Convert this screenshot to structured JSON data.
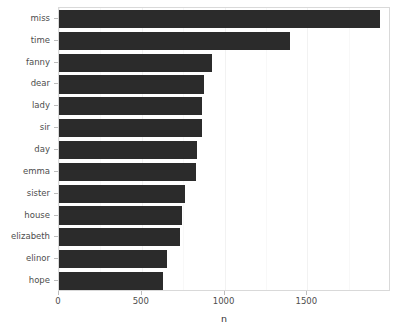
{
  "chart_data": {
    "type": "bar",
    "orientation": "horizontal",
    "title": "",
    "subtitle": "",
    "xlabel": "n",
    "ylabel": "",
    "categories": [
      "miss",
      "time",
      "fanny",
      "dear",
      "lady",
      "sir",
      "day",
      "emma",
      "sister",
      "house",
      "elizabeth",
      "elinor",
      "hope"
    ],
    "values": [
      1940,
      1395,
      925,
      877,
      865,
      862,
      834,
      828,
      762,
      743,
      731,
      653,
      628
    ],
    "xlim": [
      0,
      2005
    ],
    "ylim": null,
    "xticks": [
      0,
      500,
      1000,
      1500
    ],
    "xticklabels": [
      "0",
      "500",
      "1000",
      "1500"
    ],
    "yticklabels": [
      "miss",
      "time",
      "fanny",
      "dear",
      "lady",
      "sir",
      "day",
      "emma",
      "sister",
      "house",
      "elizabeth",
      "elinor",
      "hope"
    ],
    "grid": true,
    "legend": null,
    "bar_color": "#2b2b2b",
    "panel_background": "#ffffff",
    "panel_border_color": "#d9d9d9",
    "gridline_color": "#f2f2f2",
    "axis_text_color": "#4d4d4d"
  }
}
